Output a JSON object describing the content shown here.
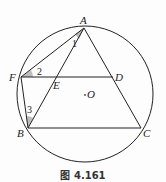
{
  "figure": {
    "caption": "图 4.161",
    "circle": {
      "center_label": "O",
      "cx": 85,
      "cy": 94,
      "r": 68
    },
    "points": {
      "A": {
        "label": "A",
        "x": 84,
        "y": 28
      },
      "B": {
        "label": "B",
        "x": 28,
        "y": 128
      },
      "C": {
        "label": "C",
        "x": 141,
        "y": 128
      },
      "D": {
        "label": "D",
        "x": 113,
        "y": 77
      },
      "E": {
        "label": "E",
        "x": 56,
        "y": 77
      },
      "F": {
        "label": "F",
        "x": 21,
        "y": 77
      }
    },
    "segments": [
      "AB",
      "AC",
      "BC",
      "FD",
      "AF",
      "FB"
    ],
    "angles": [
      {
        "label": "1",
        "vertex": "A"
      },
      {
        "label": "2",
        "vertex": "F"
      },
      {
        "label": "3",
        "vertex": "B"
      }
    ],
    "colors": {
      "line": "#222222",
      "shade": "#bdbdbd"
    }
  }
}
